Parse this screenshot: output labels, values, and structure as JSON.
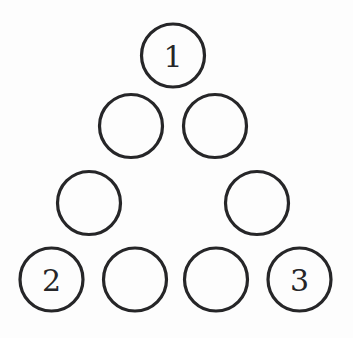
{
  "figure": {
    "background_color": "#fdfdfd",
    "stroke_color": "#262628",
    "fill_color": "#fdfdfd",
    "stroke_width": 3.2,
    "radius": 31.5,
    "width": 353,
    "height": 338,
    "rows": [
      {
        "row_index": 1,
        "nodes": [
          {
            "id": "r1c1",
            "label": "1",
            "cx": 173,
            "cy": 55.5
          }
        ]
      },
      {
        "row_index": 2,
        "nodes": [
          {
            "id": "r2c1",
            "label": "",
            "cx": 131,
            "cy": 126
          },
          {
            "id": "r2c2",
            "label": "",
            "cx": 215,
            "cy": 126
          }
        ]
      },
      {
        "row_index": 3,
        "nodes": [
          {
            "id": "r3c1",
            "label": "",
            "cx": 89,
            "cy": 203
          },
          {
            "id": "r3c2",
            "label": "",
            "cx": 257,
            "cy": 203
          }
        ]
      },
      {
        "row_index": 4,
        "nodes": [
          {
            "id": "r4c1",
            "label": "2",
            "cx": 51.5,
            "cy": 279.5
          },
          {
            "id": "r4c2",
            "label": "",
            "cx": 135,
            "cy": 279.5
          },
          {
            "id": "r4c3",
            "label": "",
            "cx": 216,
            "cy": 279.5
          },
          {
            "id": "r4c4",
            "label": "3",
            "cx": 299.5,
            "cy": 279.5
          }
        ]
      }
    ],
    "labels": [
      "1",
      "2",
      "3"
    ],
    "total_circles": 9,
    "labeled_circles": 3,
    "empty_circles": 6
  }
}
